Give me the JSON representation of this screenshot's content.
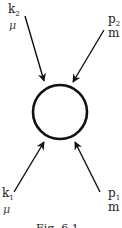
{
  "diagram": {
    "type": "feynman-vertex",
    "vertex": {
      "shape": "circle",
      "cx": 60,
      "cy": 112,
      "r": 27
    },
    "lines": [
      {
        "id": "k2",
        "label": "k",
        "subscript": "2",
        "index": "μ",
        "from": [
          25,
          16
        ],
        "to": [
          44,
          82
        ],
        "direction": "incoming"
      },
      {
        "id": "p2",
        "label": "p",
        "subscript": "2",
        "index": "m",
        "from": [
          104,
          30
        ],
        "to": [
          73,
          82
        ],
        "direction": "incoming"
      },
      {
        "id": "k1",
        "label": "k",
        "subscript": "1",
        "index": "μ",
        "from": [
          14,
          192
        ],
        "to": [
          44,
          141
        ],
        "direction": "incoming"
      },
      {
        "id": "p1",
        "label": "p",
        "subscript": "1",
        "index": "m",
        "from": [
          100,
          192
        ],
        "to": [
          75,
          141
        ],
        "direction": "incoming"
      }
    ],
    "caption": "Fig. 6.1"
  },
  "labels": {
    "k2": {
      "main": "k",
      "sub": "2",
      "index": "μ"
    },
    "p2": {
      "main": "p",
      "sub": "2",
      "index": "m"
    },
    "k1": {
      "main": "k",
      "sub": "1",
      "index": "μ"
    },
    "p1": {
      "main": "p",
      "sub": "1",
      "index": "m"
    }
  },
  "caption": "Fig. 6.1",
  "colors": {
    "line": "#111111",
    "text": "#222222",
    "background": "#ffffff"
  }
}
